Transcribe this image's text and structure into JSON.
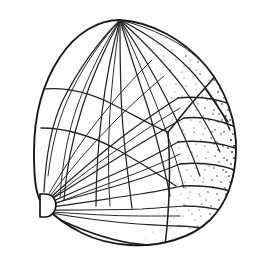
{
  "figure": {
    "caption_visible": false,
    "style": "pen-and-ink line drawing with stipple shading",
    "background_color": "#ffffff",
    "ink_color": "#1a1a1a",
    "canvas": {
      "width": 262,
      "height": 263
    }
  },
  "geometry": {
    "apex": {
      "x": 120,
      "y": 20,
      "label": "apex-node"
    },
    "hilum_node": {
      "x": 44,
      "y": 205,
      "label": "lower-left-fan-node"
    },
    "mid_junction": {
      "x": 168,
      "y": 132,
      "label": "mid-right-junction"
    },
    "upper_junction": {
      "x": 205,
      "y": 88,
      "label": "upper-right-junction"
    },
    "widest_right_x": 237,
    "lowest_y": 246,
    "leftmost_x": 34
  },
  "outline": {
    "name": "body-outline",
    "path": "M120,20 C152,22 184,40 206,66 C226,90 237,122 236,152 C235,180 226,204 210,220 C192,238 160,247 130,245 C112,244 96,240 82,233 C68,226 55,217 44,206 C36,197 34,183 34,152 C34,118 42,84 60,57 C76,33 98,20 120,20 Z"
  },
  "ribs_upper": {
    "name": "apex-radial-ribs",
    "count": 13,
    "description": "ribs radiating from apex down across the dome"
  },
  "ribs_lower": {
    "name": "hilum-radial-ribs",
    "count": 12,
    "description": "ribs radiating from the lower-left hilum node to the right"
  },
  "bands": {
    "name": "right-transverse-bands",
    "count": 7,
    "description": "transverse band lines crossing the stippled right flank"
  },
  "arcs": {
    "name": "transverse-arcs",
    "count": 2,
    "description": "curved transverse arcs crossing the upper-left fan"
  },
  "stipple": {
    "name": "stipple-shading",
    "description": "fine dot shading concentrated along the right flank",
    "dot_count": 430,
    "color": "#1a1a1a"
  },
  "hilum": {
    "name": "hilum-scar",
    "shape": "half-disc with flat left edge",
    "x": 38,
    "y": 194,
    "width": 16,
    "height": 23
  }
}
